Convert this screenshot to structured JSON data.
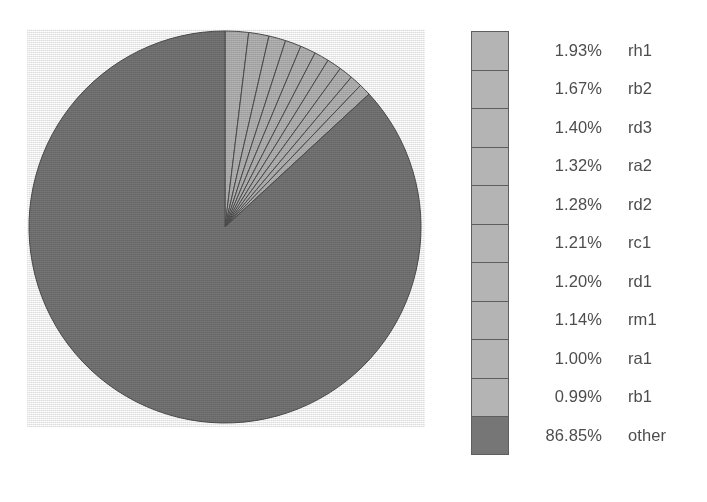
{
  "chart_data": {
    "type": "pie",
    "title": "",
    "subtitle": "",
    "xlabel": "",
    "ylabel": "",
    "legend_position": "right",
    "grid": false,
    "start_angle_deg": 0,
    "direction": "clockwise",
    "value_unit": "%",
    "categories": [
      "rh1",
      "rb2",
      "rd3",
      "ra2",
      "rd2",
      "rc1",
      "rd1",
      "rm1",
      "ra1",
      "rb1",
      "other"
    ],
    "values": [
      1.93,
      1.67,
      1.4,
      1.32,
      1.28,
      1.21,
      1.2,
      1.14,
      1.0,
      0.99,
      86.85
    ],
    "value_labels": [
      "1.93%",
      "1.67%",
      "1.40%",
      "1.32%",
      "1.28%",
      "1.21%",
      "1.20%",
      "1.14%",
      "1.00%",
      "0.99%",
      "86.85%"
    ],
    "slice_colors": [
      "#b4b4b4",
      "#b4b4b4",
      "#b4b4b4",
      "#b4b4b4",
      "#b4b4b4",
      "#b4b4b4",
      "#b4b4b4",
      "#b4b4b4",
      "#b4b4b4",
      "#b4b4b4",
      "#767676"
    ]
  },
  "colors": {
    "slice_light": "#b4b4b4",
    "slice_dark": "#767676",
    "slice_outline": "#4f4f4f",
    "swatch_light": "#b4b4b4",
    "swatch_dark": "#767676",
    "swatch_border": "#5e5e5e",
    "text": "#4d4d4d",
    "background": "#ffffff"
  },
  "pie": {
    "center_x": 198,
    "center_y": 198,
    "radius": 196
  },
  "legend": {
    "rows": [
      {
        "value": "1.93%",
        "label": "rh1",
        "color": "#b4b4b4"
      },
      {
        "value": "1.67%",
        "label": "rb2",
        "color": "#b4b4b4"
      },
      {
        "value": "1.40%",
        "label": "rd3",
        "color": "#b4b4b4"
      },
      {
        "value": "1.32%",
        "label": "ra2",
        "color": "#b4b4b4"
      },
      {
        "value": "1.28%",
        "label": "rd2",
        "color": "#b4b4b4"
      },
      {
        "value": "1.21%",
        "label": "rc1",
        "color": "#b4b4b4"
      },
      {
        "value": "1.20%",
        "label": "rd1",
        "color": "#b4b4b4"
      },
      {
        "value": "1.14%",
        "label": "rm1",
        "color": "#b4b4b4"
      },
      {
        "value": "1.00%",
        "label": "ra1",
        "color": "#b4b4b4"
      },
      {
        "value": "0.99%",
        "label": "rb1",
        "color": "#b4b4b4"
      },
      {
        "value": "86.85%",
        "label": "other",
        "color": "#767676"
      }
    ]
  }
}
